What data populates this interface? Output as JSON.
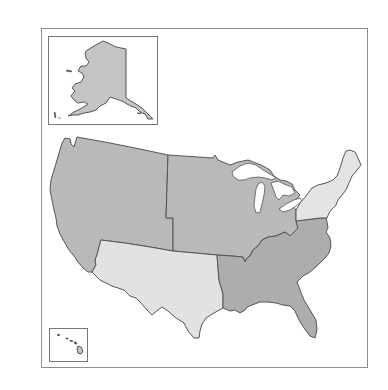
{
  "map": {
    "title": "",
    "colors": {
      "background": "#ffffff",
      "frame": "#8e8e8e",
      "border": "#555555",
      "west": "#b9b9b9",
      "midwest": "#b9b9b9",
      "southeast": "#adadad",
      "southwest": "#e2e2e2",
      "northeast": "#e4e4e4",
      "alaska": "#c4c4c4"
    },
    "regions": [
      {
        "id": "west",
        "label": "West",
        "shade": "dark"
      },
      {
        "id": "midwest",
        "label": "Midwest",
        "shade": "dark"
      },
      {
        "id": "southwest",
        "label": "Southwest",
        "shade": "light"
      },
      {
        "id": "southeast",
        "label": "Southeast",
        "shade": "dark"
      },
      {
        "id": "northeast",
        "label": "Northeast",
        "shade": "light"
      }
    ],
    "insets": [
      {
        "id": "alaska",
        "label": "Alaska"
      },
      {
        "id": "hawaii",
        "label": "Hawaii"
      }
    ]
  }
}
